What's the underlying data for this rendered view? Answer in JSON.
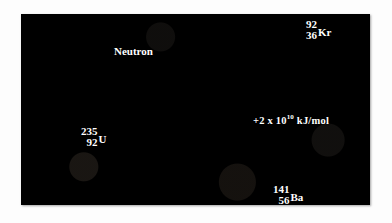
{
  "figure": {
    "background_color": "#ffffff",
    "panel_color": "#000000"
  },
  "labels": {
    "neutron": "Neutron",
    "uranium": {
      "mass_number": "235",
      "atomic_number": "92",
      "symbol": "U"
    },
    "krypton": {
      "mass_number": "92",
      "atomic_number": "36",
      "symbol": "Kr"
    },
    "barium": {
      "mass_number": "141",
      "atomic_number": "56",
      "symbol": "Ba"
    },
    "energy": {
      "prefix": "+2 x 10",
      "exponent": "10",
      "unit": " kJ/mol"
    }
  },
  "colors": {
    "uranium_sphere": "#e8638f",
    "neutron_sphere": "#f2e07a",
    "fragment_sphere": "#f0b986",
    "burst_core": "#fffbe8",
    "burst_glow": "#d8c24a",
    "arrow": "#c9c9c9",
    "label_text": "#ffffff"
  },
  "elements": {
    "arrow_name": "reaction-arrow",
    "burst_name": "fission-burst",
    "incoming_trail": "incoming-neutron-trail",
    "product_trails": 5
  }
}
